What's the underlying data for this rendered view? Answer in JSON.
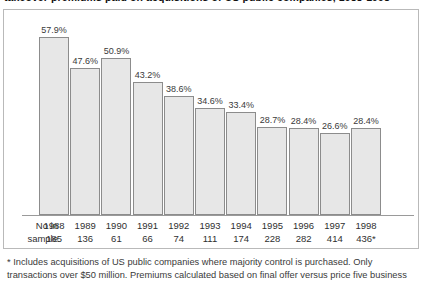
{
  "title": {
    "text": "takeover premiums paid on acquisitions of US public companies, 1988-1998"
  },
  "chart_data": {
    "type": "bar",
    "title": "",
    "xlabel": "",
    "ylabel": "",
    "ylim": [
      0,
      62
    ],
    "grid": false,
    "legend": null,
    "categories": [
      "1988",
      "1989",
      "1990",
      "1991",
      "1992",
      "1993",
      "1994",
      "1995",
      "1996",
      "1997",
      "1998"
    ],
    "values": [
      57.9,
      47.6,
      50.9,
      43.2,
      38.6,
      34.6,
      33.4,
      28.7,
      28.4,
      26.6,
      28.4
    ],
    "value_labels": [
      "57.9%",
      "47.6%",
      "50.9%",
      "43.2%",
      "38.6%",
      "34.6%",
      "33.4%",
      "28.7%",
      "28.4%",
      "26.6%",
      "28.4%"
    ],
    "sample_sizes": [
      "185",
      "136",
      "61",
      "66",
      "74",
      "111",
      "174",
      "228",
      "282",
      "414",
      "436*"
    ],
    "bar_fill": "#e7e7e7",
    "bar_border": "#8c8c8c"
  },
  "axis": {
    "row_label_line1": "No in",
    "row_label_line2": "sample"
  },
  "footnote": {
    "line1": "* Includes acquisitions of US public companies where majority control is purchased. Only",
    "line2": "transactions over $50 million. Premiums calculated based on final offer versus price five business"
  }
}
